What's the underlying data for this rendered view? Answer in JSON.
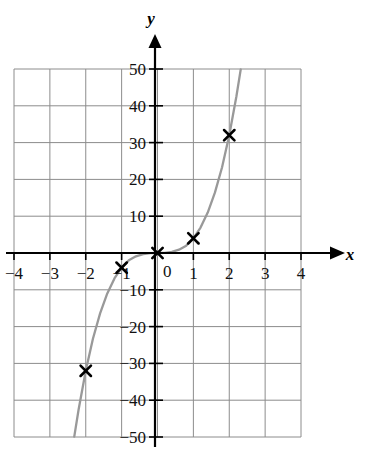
{
  "chart_data": {
    "type": "line",
    "title": "",
    "subtitle": "",
    "xlabel": "x",
    "ylabel": "y",
    "xlim": [
      -4,
      4
    ],
    "ylim": [
      -50,
      50
    ],
    "grid": true,
    "legend": null,
    "x_ticks": [
      -4,
      -3,
      -2,
      -1,
      1,
      2,
      3,
      4
    ],
    "x_tick_labels": [
      "−4",
      "−3",
      "−2",
      "−1",
      "1",
      "2",
      "3",
      "4"
    ],
    "y_ticks": [
      50,
      40,
      30,
      20,
      10,
      -10,
      -20,
      -30,
      -40,
      -50
    ],
    "y_tick_labels": [
      "50",
      "40",
      "30",
      "20",
      "10",
      "−10",
      "−20",
      "−30",
      "−40",
      "−50"
    ],
    "origin_label": "0",
    "series": [
      {
        "name": "y = 4x^3",
        "kind": "curve",
        "color": "#999999",
        "x": [
          -2.32,
          -2.2,
          -2.0,
          -1.8,
          -1.6,
          -1.4,
          -1.2,
          -1.0,
          -0.8,
          -0.6,
          -0.4,
          -0.2,
          0.0,
          0.2,
          0.4,
          0.6,
          0.8,
          1.0,
          1.2,
          1.4,
          1.6,
          1.8,
          2.0,
          2.2,
          2.32
        ],
        "values": [
          -49.9,
          -42.6,
          -32.0,
          -23.3,
          -16.4,
          -11.0,
          -6.9,
          -4.0,
          -2.0,
          -0.9,
          -0.3,
          -0.03,
          0.0,
          0.03,
          0.3,
          0.9,
          2.0,
          4.0,
          6.9,
          11.0,
          16.4,
          23.3,
          32.0,
          42.6,
          49.9
        ]
      },
      {
        "name": "plotted points",
        "kind": "markers",
        "marker": "x-cross",
        "color": "#000000",
        "points": [
          {
            "x": -2,
            "y": -32
          },
          {
            "x": -1,
            "y": -4
          },
          {
            "x": 0,
            "y": 0
          },
          {
            "x": 1,
            "y": 4
          },
          {
            "x": 2,
            "y": 32
          }
        ]
      }
    ]
  },
  "colors": {
    "curve": "#999999",
    "grid": "#8c8c8c",
    "axis": "#000000",
    "marker": "#000000",
    "background": "#ffffff"
  }
}
